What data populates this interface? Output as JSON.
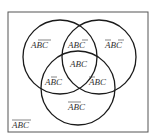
{
  "diagram": {
    "type": "venn",
    "sets": [
      "A",
      "B",
      "C"
    ],
    "colors": {
      "line": "#1a1a1a",
      "text": "#333333",
      "background": "#ffffff"
    },
    "regions": [
      {
        "id": "a_only",
        "label": "ABC",
        "bars": "BC",
        "text": "A B̄ C̄"
      },
      {
        "id": "ab_notc",
        "label": "ABC",
        "bars": "C",
        "text": "A B C̄"
      },
      {
        "id": "b_only",
        "label": "ABC",
        "bars": "AC",
        "text": "Ā B C̄"
      },
      {
        "id": "abc",
        "label": "ABC",
        "bars": "",
        "text": "A B C"
      },
      {
        "id": "ac_notb",
        "label": "ABC",
        "bars": "B",
        "text": "A B̄ C"
      },
      {
        "id": "bc_nota",
        "label": "ABC",
        "bars": "A",
        "text": "Ā B C"
      },
      {
        "id": "c_only",
        "label": "ABC",
        "bars": "AB",
        "text": "Ā B̄ C"
      },
      {
        "id": "outside",
        "label": "ABC",
        "bars": "ABC",
        "text": "complement of A∪B∪C"
      }
    ]
  }
}
